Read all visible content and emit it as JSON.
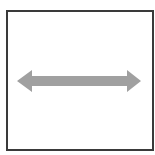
{
  "icon": {
    "name": "double-headed-horizontal-arrow",
    "frame_color": "#3a3a3a",
    "arrow_color": "#a0a0a0"
  }
}
